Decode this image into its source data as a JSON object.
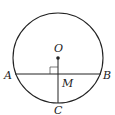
{
  "diagram": {
    "type": "geometry",
    "circle": {
      "cx": 58,
      "cy": 58,
      "r": 45
    },
    "points": {
      "O": {
        "label": "O",
        "x": 58,
        "y": 58
      },
      "A": {
        "label": "A",
        "x": 15,
        "y": 74
      },
      "B": {
        "label": "B",
        "x": 101,
        "y": 74
      },
      "M": {
        "label": "M",
        "x": 58,
        "y": 74
      },
      "C": {
        "label": "C",
        "x": 58,
        "y": 103
      }
    },
    "segments": [
      "AB",
      "OC"
    ],
    "right_angle_marker": {
      "at": "M",
      "between": [
        "MA",
        "MO"
      ]
    },
    "colors": {
      "stroke": "#222222",
      "background": "#ffffff"
    }
  }
}
